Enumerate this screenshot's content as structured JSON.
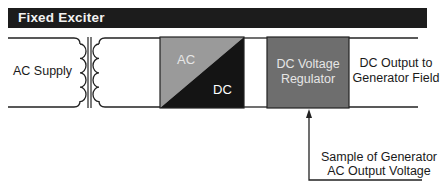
{
  "header": {
    "title": "Fixed Exciter"
  },
  "labels": {
    "ac_supply": "AC Supply",
    "rectifier_ac": "AC",
    "rectifier_dc": "DC",
    "regulator_line1": "DC Voltage",
    "regulator_line2": "Regulator",
    "output_line1": "DC Output to",
    "output_line2": "Generator Field",
    "sample_line1": "Sample of Generator",
    "sample_line2": "AC Output Voltage"
  },
  "colors": {
    "header_bg": "#1c1c1c",
    "rectifier_ac": "#9a9a9a",
    "rectifier_dc": "#141414",
    "regulator": "#6e6e6e",
    "line": "#222222"
  },
  "components": [
    {
      "id": "transformer",
      "type": "transformer"
    },
    {
      "id": "rectifier",
      "type": "block",
      "label": "AC / DC"
    },
    {
      "id": "regulator",
      "type": "block",
      "label": "DC Voltage Regulator"
    }
  ]
}
